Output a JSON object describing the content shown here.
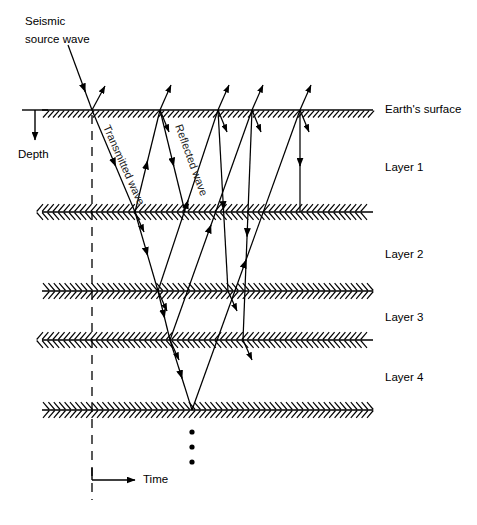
{
  "figure": {
    "background_color": "#ffffff",
    "line_color": "#000000",
    "width": 477,
    "height": 525
  },
  "annotations": {
    "source_label_line1": "Seismic",
    "source_label_line2": "source wave",
    "transmitted_label": "Transmitted wave",
    "reflected_label": "Reflected wave",
    "depth_label": "Depth",
    "time_label": "Time",
    "vertical_ellipsis": "⋮"
  },
  "boundaries": [
    {
      "name": "earth-surface",
      "label": "Earth's surface",
      "y": 110,
      "hatch_dir": "right",
      "hatch_style": "slant",
      "label_x": 385,
      "label_y": 110
    },
    {
      "name": "layer1-base",
      "label": "",
      "y": 212,
      "hatch_dir": "left",
      "hatch_style": "chevron",
      "label_x": 0,
      "label_y": 0
    },
    {
      "name": "layer2-base",
      "label": "",
      "y": 291,
      "hatch_dir": "right",
      "hatch_style": "chevron",
      "label_x": 0,
      "label_y": 0
    },
    {
      "name": "layer3-base",
      "label": "",
      "y": 340,
      "hatch_dir": "left",
      "hatch_style": "chevron",
      "label_x": 0,
      "label_y": 0
    },
    {
      "name": "layer4-base",
      "label": "",
      "y": 410,
      "hatch_dir": "right",
      "hatch_style": "chevron",
      "label_x": 0,
      "label_y": 0
    }
  ],
  "layer_labels": [
    {
      "name": "layer-1-label",
      "text": "Layer 1",
      "x": 385,
      "y": 168
    },
    {
      "name": "layer-2-label",
      "text": "Layer 2",
      "x": 385,
      "y": 255
    },
    {
      "name": "layer-3-label",
      "text": "Layer 3",
      "x": 385,
      "y": 318
    },
    {
      "name": "layer-4-label",
      "text": "Layer 4",
      "x": 385,
      "y": 378
    }
  ],
  "geometry": {
    "boundary_x_start": 42,
    "boundary_x_end": 373,
    "source_x": 92,
    "source_y": 110,
    "source_ray_start_x": 68,
    "source_ray_start_y": 45,
    "convergence_x": 192,
    "convergence_y": 410,
    "dashed_x": 92,
    "dashed_y_top": 115,
    "dashed_y_bottom": 500,
    "surface_bounce_x": [
      160,
      218,
      252,
      300
    ],
    "depth_tick_x1": 22,
    "depth_tick_x2": 48,
    "depth_arrow_y_end": 140,
    "time_arrow_y": 480,
    "time_arrow_x_end": 135,
    "ellipsis_x": 192,
    "ellipsis_y": [
      432,
      447,
      462
    ]
  }
}
